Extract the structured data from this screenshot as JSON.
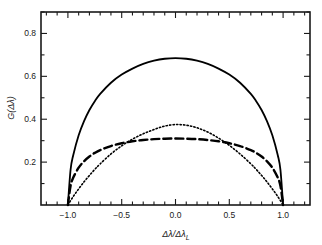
{
  "chart_data": {
    "type": "line",
    "title": "",
    "xlabel": "Δλ/Δλ",
    "xlabel_sub": "L",
    "ylabel": "G(Δλ)",
    "xlim": [
      -1.25,
      1.25
    ],
    "ylim": [
      0.0,
      0.9
    ],
    "grid": false,
    "legend": "none",
    "xticks": [
      -1.0,
      -0.5,
      0.0,
      0.5,
      1.0
    ],
    "xticklabels": [
      "−1.0",
      "−0.5",
      "0.0",
      "0.5",
      "1.0"
    ],
    "yticks": [
      0.2,
      0.4,
      0.6,
      0.8
    ],
    "yticklabels": [
      "0.2",
      "0.4",
      "0.6",
      "0.8"
    ],
    "xminor_step": 0.1,
    "yminor_step": 0.1,
    "series": [
      {
        "name": "solid",
        "style": "solid",
        "color": "#000000",
        "peak_x": 0.0,
        "peak_y": 0.7,
        "x": [
          -1.0,
          -0.975,
          -0.95,
          -0.9,
          -0.85,
          -0.8,
          -0.75,
          -0.7,
          -0.6,
          -0.5,
          -0.4,
          -0.3,
          -0.2,
          -0.1,
          0.0,
          0.1,
          0.2,
          0.3,
          0.4,
          0.5,
          0.6,
          0.7,
          0.75,
          0.8,
          0.85,
          0.9,
          0.95,
          0.975,
          1.0
        ],
        "y": [
          0.0,
          0.165,
          0.233,
          0.325,
          0.391,
          0.443,
          0.484,
          0.518,
          0.57,
          0.608,
          0.636,
          0.658,
          0.673,
          0.682,
          0.685,
          0.682,
          0.673,
          0.658,
          0.636,
          0.608,
          0.57,
          0.518,
          0.484,
          0.443,
          0.391,
          0.325,
          0.233,
          0.165,
          0.0
        ]
      },
      {
        "name": "dotted",
        "style": "dotted",
        "color": "#000000",
        "peak_x": 0.0,
        "peak_y": 0.378,
        "x": [
          -1.0,
          -0.95,
          -0.9,
          -0.85,
          -0.8,
          -0.75,
          -0.7,
          -0.6,
          -0.5,
          -0.4,
          -0.3,
          -0.2,
          -0.1,
          0.0,
          0.1,
          0.2,
          0.3,
          0.4,
          0.5,
          0.6,
          0.7,
          0.75,
          0.8,
          0.85,
          0.9,
          0.95,
          1.0
        ],
        "y": [
          0.0,
          0.04,
          0.075,
          0.108,
          0.138,
          0.166,
          0.192,
          0.238,
          0.276,
          0.307,
          0.332,
          0.352,
          0.368,
          0.375,
          0.372,
          0.36,
          0.34,
          0.312,
          0.278,
          0.238,
          0.192,
          0.166,
          0.138,
          0.108,
          0.075,
          0.04,
          0.0
        ]
      },
      {
        "name": "dashed",
        "style": "dashed",
        "color": "#000000",
        "peak_x": 0.0,
        "peak_y": 0.312,
        "x": [
          -1.0,
          -0.975,
          -0.95,
          -0.9,
          -0.85,
          -0.8,
          -0.75,
          -0.7,
          -0.6,
          -0.5,
          -0.4,
          -0.3,
          -0.2,
          -0.1,
          0.0,
          0.1,
          0.2,
          0.3,
          0.4,
          0.5,
          0.6,
          0.7,
          0.75,
          0.8,
          0.85,
          0.9,
          0.95,
          0.975,
          1.0
        ],
        "y": [
          0.0,
          0.09,
          0.128,
          0.174,
          0.204,
          0.226,
          0.243,
          0.256,
          0.275,
          0.288,
          0.297,
          0.303,
          0.307,
          0.309,
          0.31,
          0.309,
          0.307,
          0.303,
          0.297,
          0.288,
          0.275,
          0.256,
          0.243,
          0.226,
          0.204,
          0.174,
          0.128,
          0.09,
          0.0
        ]
      }
    ]
  }
}
